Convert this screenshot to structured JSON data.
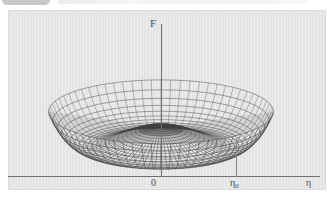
{
  "figure": {
    "kind": "3d-wireframe-surface",
    "panel_color": "#e4e4e4",
    "axis_color": "#6e6e6e",
    "mesh_color": "#3c3c3c"
  },
  "axes": {
    "vertical_label": "F",
    "origin_label": "0",
    "tick_label": "η₀",
    "tick_label_base": "η",
    "tick_label_sub": "0",
    "horizontal_label": "η"
  },
  "chart_data": {
    "type": "line",
    "title": "",
    "subtitle": "",
    "xlabel": "η",
    "ylabel": "F",
    "grid": false,
    "legend": "none",
    "surface": "F(η) = a·η⁴ - b·η²  (Mexican hat potential, revolved about the F axis)",
    "xlim": [
      -2.1,
      2.1
    ],
    "ylim": [
      -0.35,
      1.05
    ],
    "x_ticks": [
      "0",
      "η₀"
    ],
    "x_tick_values": [
      0,
      1
    ],
    "annotations": [
      "central maximum of F at η = 0",
      "circular minimum (degenerate vacuum) at η = η₀",
      "dashed drop line from the rim minimum down to the η axis at η₀"
    ],
    "profile_x": [
      -2.0,
      -1.8,
      -1.6,
      -1.4,
      -1.2,
      -1.0,
      -0.8,
      -0.6,
      -0.4,
      -0.2,
      0.0,
      0.2,
      0.4,
      0.6,
      0.8,
      1.0,
      1.2,
      1.4,
      1.6,
      1.8,
      2.0
    ],
    "profile_y": [
      0.8,
      0.4,
      0.12,
      -0.06,
      -0.17,
      -0.25,
      -0.23,
      -0.13,
      0.02,
      0.19,
      0.25,
      0.19,
      0.02,
      -0.13,
      -0.23,
      -0.25,
      -0.17,
      -0.06,
      0.12,
      0.4,
      0.8
    ],
    "series": [
      {
        "name": "F(η)",
        "x": [
          -2.0,
          -1.8,
          -1.6,
          -1.4,
          -1.2,
          -1.0,
          -0.8,
          -0.6,
          -0.4,
          -0.2,
          0.0,
          0.2,
          0.4,
          0.6,
          0.8,
          1.0,
          1.2,
          1.4,
          1.6,
          1.8,
          2.0
        ],
        "values": [
          0.8,
          0.4,
          0.12,
          -0.06,
          -0.17,
          -0.25,
          -0.23,
          -0.13,
          0.02,
          0.19,
          0.25,
          0.19,
          0.02,
          -0.13,
          -0.23,
          -0.25,
          -0.17,
          -0.06,
          0.12,
          0.4,
          0.8
        ]
      }
    ]
  },
  "top_artifact": {
    "present": true,
    "text": ""
  }
}
